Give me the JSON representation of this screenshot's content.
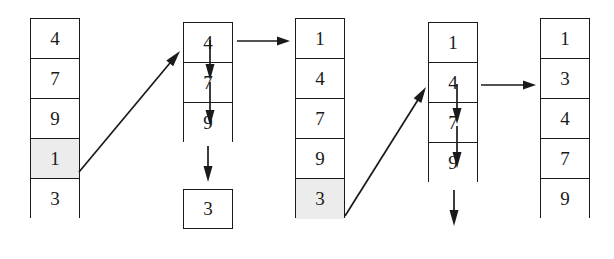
{
  "diagram": {
    "cell_width": 50,
    "cell_height": 40,
    "colors": {
      "stroke": "#1a1a1a",
      "fill": "#ffffff",
      "highlight": "#ececec"
    },
    "columns": [
      {
        "id": "column-1",
        "x": 30,
        "y": 18,
        "cells": [
          {
            "value": "4",
            "highlighted": false
          },
          {
            "value": "7",
            "highlighted": false
          },
          {
            "value": "9",
            "highlighted": false
          },
          {
            "value": "1",
            "highlighted": true
          },
          {
            "value": "3",
            "highlighted": false
          }
        ]
      },
      {
        "id": "column-2",
        "x": 183,
        "y": 22,
        "cells": [
          {
            "value": "4",
            "highlighted": false
          },
          {
            "value": "7",
            "highlighted": false
          },
          {
            "value": "9",
            "highlighted": false
          }
        ],
        "detached": {
          "value": "3",
          "x": 183,
          "y": 189
        }
      },
      {
        "id": "column-3",
        "x": 295,
        "y": 18,
        "cells": [
          {
            "value": "1",
            "highlighted": false
          },
          {
            "value": "4",
            "highlighted": false
          },
          {
            "value": "7",
            "highlighted": false
          },
          {
            "value": "9",
            "highlighted": false
          },
          {
            "value": "3",
            "highlighted": true
          }
        ]
      },
      {
        "id": "column-4",
        "x": 428,
        "y": 22,
        "cells": [
          {
            "value": "1",
            "highlighted": false
          },
          {
            "value": "4",
            "highlighted": false
          },
          {
            "value": "7",
            "highlighted": false
          },
          {
            "value": "9",
            "highlighted": false
          }
        ]
      },
      {
        "id": "column-5",
        "x": 540,
        "y": 18,
        "cells": [
          {
            "value": "1",
            "highlighted": false
          },
          {
            "value": "3",
            "highlighted": false
          },
          {
            "value": "4",
            "highlighted": false
          },
          {
            "value": "7",
            "highlighted": false
          },
          {
            "value": "9",
            "highlighted": false
          }
        ]
      }
    ],
    "arrows": [
      {
        "id": "diagonal-arrow-1",
        "kind": "diagonal",
        "x1": 79,
        "y1": 172,
        "x2": 180,
        "y2": 51
      },
      {
        "id": "shift-arrow-1a",
        "kind": "vertical",
        "x1": 210,
        "y1": 40,
        "x2": 210,
        "y2": 80
      },
      {
        "id": "shift-arrow-1b",
        "kind": "vertical",
        "x1": 210,
        "y1": 82,
        "x2": 210,
        "y2": 126
      },
      {
        "id": "eject-arrow-1",
        "kind": "vertical",
        "x1": 208,
        "y1": 146,
        "x2": 208,
        "y2": 182
      },
      {
        "id": "transition-arrow-1",
        "kind": "horizontal",
        "x1": 237,
        "y1": 41,
        "x2": 290,
        "y2": 41
      },
      {
        "id": "diagonal-arrow-2",
        "kind": "diagonal",
        "x1": 345,
        "y1": 216,
        "x2": 426,
        "y2": 87
      },
      {
        "id": "shift-arrow-2a",
        "kind": "vertical",
        "x1": 457,
        "y1": 84,
        "x2": 457,
        "y2": 124
      },
      {
        "id": "shift-arrow-2b",
        "kind": "vertical",
        "x1": 457,
        "y1": 126,
        "x2": 457,
        "y2": 168
      },
      {
        "id": "eject-arrow-2",
        "kind": "vertical",
        "x1": 454,
        "y1": 190,
        "x2": 454,
        "y2": 226
      },
      {
        "id": "transition-arrow-2",
        "kind": "horizontal",
        "x1": 481,
        "y1": 85,
        "x2": 536,
        "y2": 85
      }
    ]
  }
}
